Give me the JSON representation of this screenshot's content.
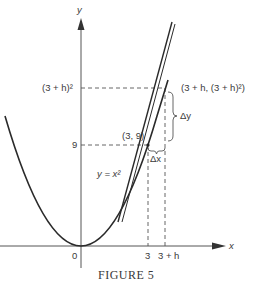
{
  "figure": {
    "caption": "FIGURE 5",
    "axes": {
      "x_label": "x",
      "y_label": "y",
      "origin_label": "0"
    },
    "curve_label": "y = x²",
    "x_ticks": [
      {
        "label": "3"
      },
      {
        "label": "3 + h"
      }
    ],
    "y_ticks": [
      {
        "label": "9"
      },
      {
        "label": "(3 + h)²"
      }
    ],
    "points": [
      {
        "label": "(3, 9)"
      },
      {
        "label": "(3 + h, (3 + h)²)"
      }
    ],
    "increments": {
      "dx": "Δx",
      "dy": "Δy"
    },
    "colors": {
      "ink": "#3a3a3a",
      "background": "#ffffff"
    }
  }
}
